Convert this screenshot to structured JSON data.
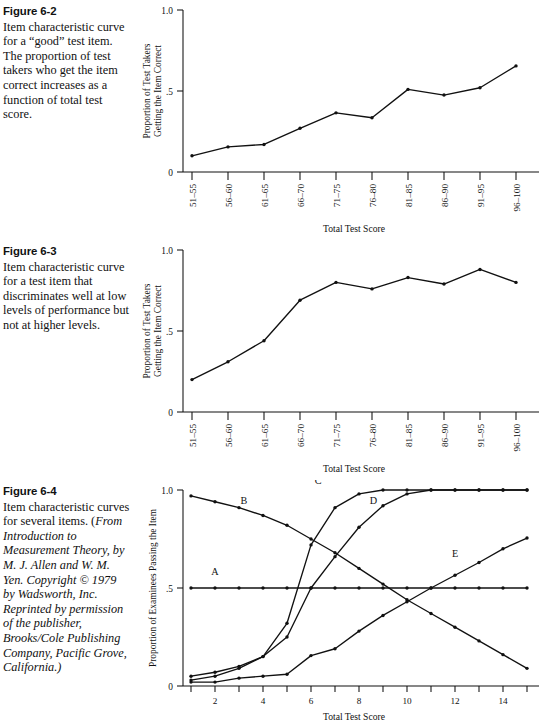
{
  "figures": [
    {
      "label": "Figure 6-2",
      "caption": "Item characteristic curve for a “good” test item. The proportion of test takers who get the item correct increases as a function of total test score.",
      "caption_italic": "",
      "y_axis_title_line1": "Proportion of Test Takers",
      "y_axis_title_line2": "Getting the Item Correct",
      "x_axis_title": "Total Test Score",
      "y_ticks": [
        "0",
        ".5",
        "1.0"
      ],
      "x_ticks": [
        "51–55",
        "56–60",
        "61–65",
        "66–70",
        "71–75",
        "76–80",
        "81–85",
        "86–90",
        "91–95",
        "96–100"
      ]
    },
    {
      "label": "Figure 6-3",
      "caption": "Item characteristic curve for a test item that discriminates well at low levels of performance but not at higher levels.",
      "caption_italic": "",
      "y_axis_title_line1": "Proportion of Test Takers",
      "y_axis_title_line2": "Getting the Item Correct",
      "x_axis_title": "Total Test Score",
      "y_ticks": [
        "0",
        ".5",
        "1.0"
      ],
      "x_ticks": [
        "51–55",
        "56–60",
        "61–65",
        "66–70",
        "71–75",
        "76–80",
        "81–85",
        "86–90",
        "91–95",
        "96–100"
      ]
    },
    {
      "label": "Figure 6-4",
      "caption": "Item characteristic curves for several items. (",
      "caption_italic": "From Introduction to Measurement Theory, by M. J. Allen and W. M. Yen. Copyright © 1979 by Wadsworth, Inc. Reprinted by permission of the publisher, Brooks/Cole Publishing Company, Pacific Grove, California.)",
      "y_axis_title_line1": "Proportion of Examinees Passing the Item",
      "y_axis_title_line2": "",
      "x_axis_title": "Total Test Score",
      "y_ticks": [
        "0",
        ".5",
        "1.0"
      ],
      "x_ticks": [
        "2",
        "4",
        "6",
        "8",
        "10",
        "12",
        "14"
      ]
    }
  ],
  "chart_data": [
    {
      "type": "line",
      "title": "Item characteristic curve for a “good” test item",
      "xlabel": "Total Test Score",
      "ylabel": "Proportion of Test Takers Getting the Item Correct",
      "categories": [
        "51–55",
        "56–60",
        "61–65",
        "66–70",
        "71–75",
        "76–80",
        "81–85",
        "86–90",
        "91–95",
        "96–100"
      ],
      "values": [
        0.1,
        0.155,
        0.17,
        0.27,
        0.365,
        0.335,
        0.51,
        0.475,
        0.52,
        0.655
      ],
      "ylim": [
        0,
        1.0
      ],
      "ytick_values": [
        0,
        0.5,
        1.0
      ],
      "grid": false,
      "legend": "none",
      "markers": true
    },
    {
      "type": "line",
      "title": "Item characteristic curve for a test item that discriminates well at low levels of performance but not at higher levels",
      "xlabel": "Total Test Score",
      "ylabel": "Proportion of Test Takers Getting the Item Correct",
      "categories": [
        "51–55",
        "56–60",
        "61–65",
        "66–70",
        "71–75",
        "76–80",
        "81–85",
        "86–90",
        "91–95",
        "96–100"
      ],
      "values": [
        0.2,
        0.31,
        0.44,
        0.69,
        0.8,
        0.76,
        0.83,
        0.79,
        0.88,
        0.8
      ],
      "ylim": [
        0,
        1.0
      ],
      "ytick_values": [
        0,
        0.5,
        1.0
      ],
      "grid": false,
      "legend": "none",
      "markers": true
    },
    {
      "type": "line",
      "title": "Item characteristic curves for several items",
      "xlabel": "Total Test Score",
      "ylabel": "Proportion of Examinees Passing the Item",
      "x": [
        1,
        2,
        3,
        4,
        5,
        6,
        7,
        8,
        9,
        10,
        11,
        12,
        13,
        14,
        15
      ],
      "ylim": [
        0,
        1.0
      ],
      "xlim": [
        1,
        15
      ],
      "ytick_values": [
        0,
        0.5,
        1.0
      ],
      "xtick_values": [
        2,
        4,
        6,
        8,
        10,
        12,
        14
      ],
      "grid": false,
      "legend": "inline-labels",
      "markers": true,
      "series": [
        {
          "name": "A",
          "label_x": 2.0,
          "label_y": 0.565,
          "values": [
            0.5,
            0.5,
            0.5,
            0.5,
            0.5,
            0.5,
            0.5,
            0.5,
            0.5,
            0.5,
            0.5,
            0.5,
            0.5,
            0.5,
            0.5
          ]
        },
        {
          "name": "B",
          "label_x": 3.2,
          "label_y": 0.93,
          "values": [
            0.97,
            0.94,
            0.91,
            0.87,
            0.82,
            0.75,
            0.68,
            0.6,
            0.52,
            0.44,
            0.37,
            0.3,
            0.23,
            0.16,
            0.09
          ]
        },
        {
          "name": "C",
          "label_x": 6.3,
          "label_y": 1.03,
          "values": [
            0.05,
            0.07,
            0.1,
            0.15,
            0.32,
            0.72,
            0.91,
            0.98,
            1.0,
            1.0,
            1.0,
            1.0,
            1.0,
            1.0,
            1.0
          ]
        },
        {
          "name": "D",
          "label_x": 8.6,
          "label_y": 0.93,
          "values": [
            0.03,
            0.05,
            0.09,
            0.15,
            0.25,
            0.5,
            0.66,
            0.81,
            0.92,
            0.98,
            1.0,
            1.0,
            1.0,
            1.0,
            1.0
          ]
        },
        {
          "name": "E",
          "label_x": 12.0,
          "label_y": 0.66,
          "values": [
            0.02,
            0.02,
            0.04,
            0.05,
            0.06,
            0.155,
            0.19,
            0.28,
            0.36,
            0.43,
            0.5,
            0.565,
            0.63,
            0.7,
            0.755
          ]
        }
      ]
    }
  ]
}
